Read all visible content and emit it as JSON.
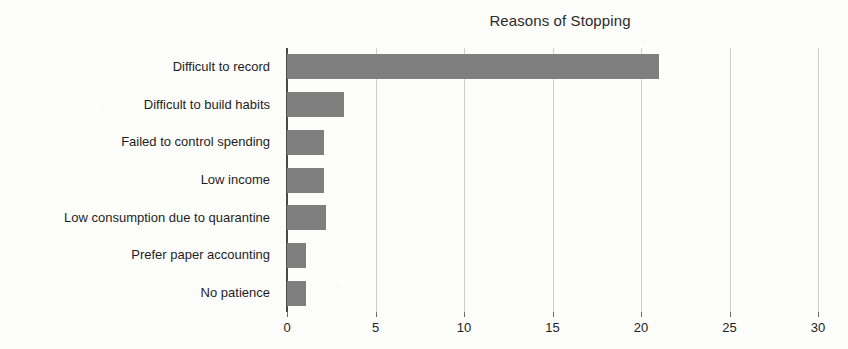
{
  "chart_data": {
    "type": "bar",
    "orientation": "horizontal",
    "title": "Reasons of Stopping",
    "xlabel": "",
    "ylabel": "",
    "xlim": [
      0,
      30
    ],
    "xticks": [
      0,
      5,
      10,
      15,
      20,
      25,
      30
    ],
    "xtick_labels": [
      "0",
      "5",
      "10",
      "15",
      "20",
      "25",
      "30"
    ],
    "grid": true,
    "grid_axis": "x",
    "legend": false,
    "bar_color": "#7f7f7f",
    "categories": [
      "Difficult to record",
      "Difficult to build habits",
      "Failed to control spending",
      "Low income",
      "Low consumption due to quarantine",
      "Prefer paper accounting",
      "No patience"
    ],
    "values": [
      21,
      3.2,
      2.1,
      2.1,
      2.2,
      1.1,
      1.1
    ]
  }
}
